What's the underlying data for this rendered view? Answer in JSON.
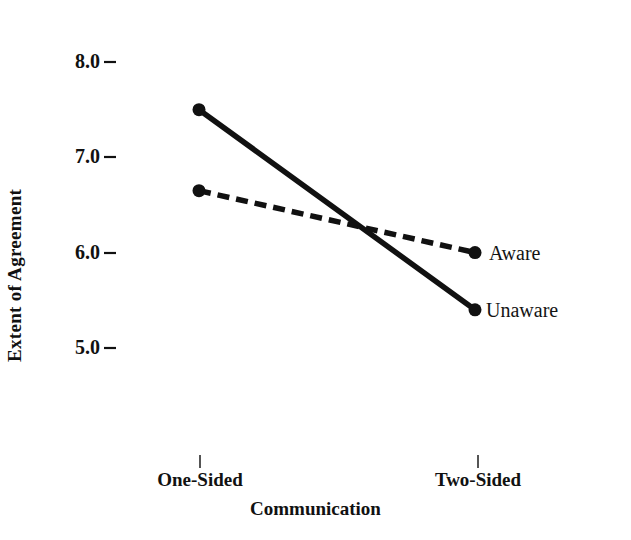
{
  "chart_data": {
    "type": "line",
    "title": "",
    "xlabel": "Communication",
    "ylabel": "Extent of Agreement",
    "categories": [
      "One-Sided",
      "Two-Sided"
    ],
    "ylim": [
      4.6,
      8.3
    ],
    "yticks": [
      8.0,
      7.0,
      6.0,
      5.0
    ],
    "ytick_labels": [
      "8.0",
      "7.0",
      "6.0",
      "5.0"
    ],
    "grid": false,
    "legend_position": "right-of-endpoints",
    "series": [
      {
        "name": "Unaware",
        "style": "solid",
        "color": "#111111",
        "marker": "circle",
        "values": [
          7.5,
          5.4
        ]
      },
      {
        "name": "Aware",
        "style": "dashed",
        "color": "#111111",
        "marker": "circle",
        "values": [
          6.65,
          6.0
        ]
      }
    ]
  },
  "axes": {
    "y": {
      "title": "Extent of Agreement",
      "ticks": [
        {
          "label": "8.0",
          "value": 8.0
        },
        {
          "label": "7.0",
          "value": 7.0
        },
        {
          "label": "6.0",
          "value": 6.0
        },
        {
          "label": "5.0",
          "value": 5.0
        }
      ]
    },
    "x": {
      "title": "Communication",
      "ticks": [
        {
          "label": "One-Sided",
          "value": 0
        },
        {
          "label": "Two-Sided",
          "value": 1
        }
      ]
    }
  },
  "series_labels": {
    "aware": "Aware",
    "unaware": "Unaware"
  },
  "colors": {
    "line": "#111111",
    "text": "#111111",
    "background": "#ffffff"
  }
}
